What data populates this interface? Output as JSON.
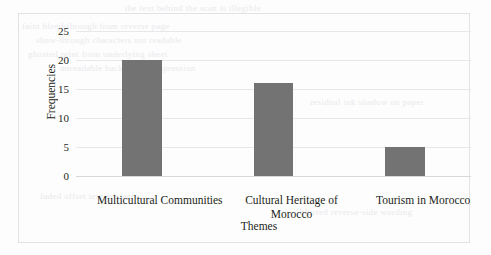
{
  "chart_data": {
    "type": "bar",
    "title": "",
    "xlabel": "Themes",
    "ylabel": "Frequencies",
    "categories": [
      "Multicultural Communities",
      "Cultural Heritage of Morocco",
      "Tourism in Morocco"
    ],
    "values": [
      20,
      16,
      5
    ],
    "yticks": [
      0,
      5,
      10,
      15,
      20,
      25
    ],
    "ylim": [
      0,
      25
    ],
    "grid": true,
    "legend": false,
    "bar_color": "#737373",
    "gridline_color": "#e8e8e8",
    "axis_color": "#d9d9d9",
    "text_color": "#231f20",
    "border_color": "#e2e2e4"
  },
  "background_text": {
    "line1": "the text behind the scan is illegible",
    "line2": "faint bleed-through from reverse page",
    "line3": "show-through characters not readable",
    "line4": "ghosted print from underlying sheet",
    "line5": "unreadable background impression",
    "line6": "residual ink shadow on paper",
    "line7": "faded offset text artifact",
    "line8": "blurred reverse-side wording"
  }
}
